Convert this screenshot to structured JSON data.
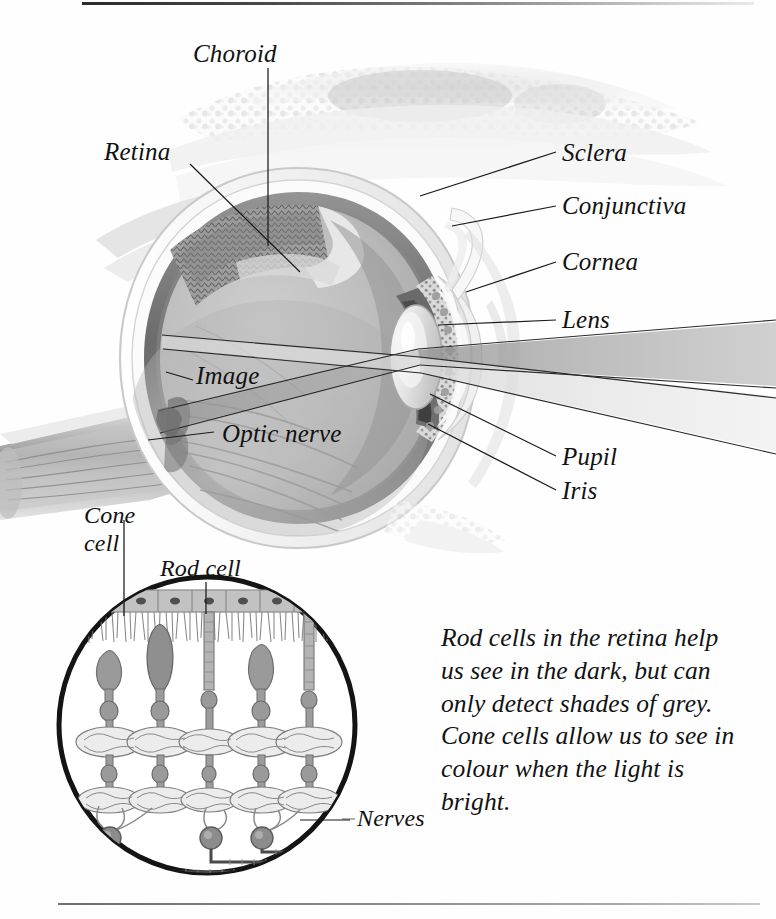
{
  "figure": {
    "labels": [
      {
        "key": "choroid",
        "text": "Choroid"
      },
      {
        "key": "retina",
        "text": "Retina"
      },
      {
        "key": "sclera",
        "text": "Sclera"
      },
      {
        "key": "conjunctiva",
        "text": "Conjunctiva"
      },
      {
        "key": "cornea",
        "text": "Cornea"
      },
      {
        "key": "lens",
        "text": "Lens"
      },
      {
        "key": "image",
        "text": "Image"
      },
      {
        "key": "optic_nerve",
        "text": "Optic nerve"
      },
      {
        "key": "pupil",
        "text": "Pupil"
      },
      {
        "key": "iris",
        "text": "Iris"
      }
    ],
    "inset": {
      "cone_cell_line1": "Cone",
      "cone_cell_line2": "cell",
      "rod_cell": "Rod cell",
      "nerves": "Nerves"
    },
    "caption": "Rod cells in the retina help us see in the dark, but can only detect shades of grey. Cone cells allow us to see in colour when the light is bright.",
    "colors": {
      "ink": "#111111",
      "leader": "#1a1a1a",
      "background": "#ffffff",
      "rule_top": "#2b2b2b",
      "rule_bottom": "#8a8a8a",
      "sclera": "#f2f2f2",
      "choroid": "#6e6e6e",
      "vitreous": "#b9b9b9",
      "ray": "#9a9a9a"
    }
  }
}
